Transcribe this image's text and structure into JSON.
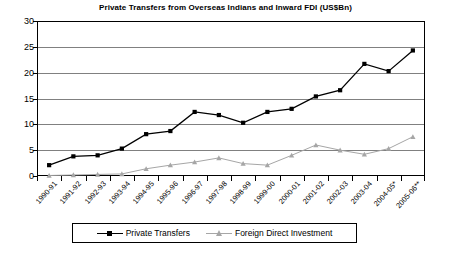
{
  "chart_data": {
    "type": "line",
    "title": "Private Transfers from Overseas Indians and Inward FDI (US$Bn)",
    "xlabel": "",
    "ylabel": "",
    "ylim": [
      0,
      30
    ],
    "yticks": [
      0,
      5,
      10,
      15,
      20,
      25,
      30
    ],
    "grid": true,
    "legend_position": "bottom",
    "categories": [
      "1990-91",
      "1991-92",
      "1992-93",
      "1993-94",
      "1994-95",
      "1995-96",
      "1996-97",
      "1997-98",
      "1998-99",
      "1999-00",
      "2000-01",
      "2001-02",
      "2002-03",
      "2003-04",
      "2004-05*",
      "2005-06**"
    ],
    "series": [
      {
        "name": "Private Transfers",
        "color": "#000000",
        "marker": "square",
        "values": [
          2.1,
          3.8,
          4.0,
          5.3,
          8.1,
          8.7,
          12.4,
          11.8,
          10.3,
          12.4,
          13.0,
          15.4,
          16.6,
          21.7,
          20.3,
          24.3
        ]
      },
      {
        "name": "Foreign Direct Investment",
        "color": "#a6a6a6",
        "marker": "triangle",
        "values": [
          0.1,
          0.2,
          0.3,
          0.4,
          1.4,
          2.1,
          2.7,
          3.5,
          2.4,
          2.1,
          4.0,
          6.0,
          5.0,
          4.2,
          5.3,
          7.6
        ]
      }
    ]
  },
  "colors": {
    "grid": "#808080",
    "frame": "#000000",
    "series_private_transfers": "#000000",
    "series_fdi": "#a6a6a6",
    "background": "#ffffff"
  }
}
